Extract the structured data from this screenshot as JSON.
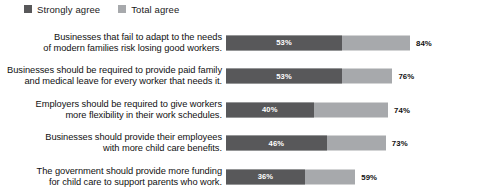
{
  "legend": {
    "items": [
      {
        "label": "Strongly agree",
        "color": "#58585a",
        "swatch_icon": "square-swatch-icon"
      },
      {
        "label": "Total agree",
        "color": "#a7a9ac",
        "swatch_icon": "square-swatch-icon"
      }
    ]
  },
  "chart_data": {
    "type": "bar",
    "title": "",
    "subtitle": "",
    "xlabel": "",
    "ylabel": "",
    "orientation": "horizontal",
    "stacked": "overlay",
    "grid": false,
    "legend_position": "top-left",
    "xlim": [
      0,
      100
    ],
    "categories": [
      "Businesses that fail to adapt to the needs of modern families risk losing good workers.",
      "Businesses should be required to provide paid family and medical leave for every worker that needs it.",
      "Employers should be required to give workers more flexibility in their work schedules.",
      "Businesses should provide their employees with more child care benefits.",
      "The government should provide more funding for child care to support parents who work."
    ],
    "category_lines": [
      [
        "Businesses that fail to adapt to the needs",
        "of modern families risk losing good workers."
      ],
      [
        "Businesses should be required to provide paid family",
        "and medical leave for every worker that needs it."
      ],
      [
        "Employers should be required to give workers",
        "more flexibility in their work schedules."
      ],
      [
        "Businesses should provide their employees",
        "with more child care benefits."
      ],
      [
        "The government should provide more funding",
        "for child care to support parents who work."
      ]
    ],
    "series": [
      {
        "name": "Strongly agree",
        "values": [
          53,
          53,
          40,
          46,
          36
        ],
        "color": "#58585a"
      },
      {
        "name": "Total agree",
        "values": [
          84,
          76,
          74,
          73,
          59
        ],
        "color": "#a7a9ac"
      }
    ],
    "strong_labels": [
      "53%",
      "53%",
      "40%",
      "46%",
      "36%"
    ],
    "total_labels": [
      "84%",
      "76%",
      "74%",
      "73%",
      "59%"
    ]
  }
}
